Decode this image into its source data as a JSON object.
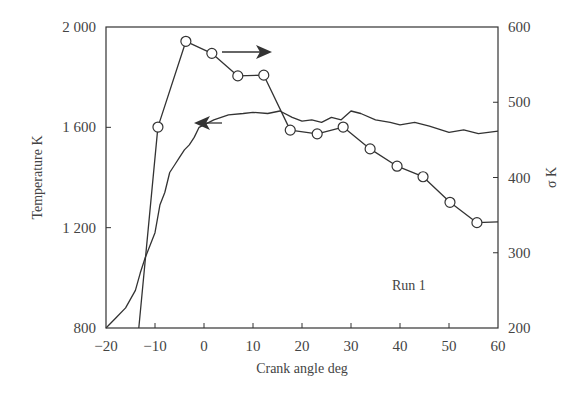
{
  "chart_data": {
    "type": "line",
    "title": "",
    "annotation": "Run 1",
    "xlabel": "Crank angle   deg",
    "ylabel_left": "Temperature   K",
    "ylabel_right": "σ   K",
    "xlim": [
      -20,
      60
    ],
    "ylim_left": [
      800,
      2000
    ],
    "ylim_right": [
      200,
      600
    ],
    "x_ticks": [
      "−20",
      "−10",
      "0",
      "10",
      "20",
      "30",
      "40",
      "50",
      "60"
    ],
    "x_tick_values": [
      -20,
      -10,
      0,
      10,
      20,
      30,
      40,
      50,
      60
    ],
    "y_left_ticks": [
      "800",
      "1 200",
      "1 600",
      "2 000"
    ],
    "y_left_tick_values": [
      800,
      1200,
      1600,
      2000
    ],
    "y_right_ticks": [
      "200",
      "300",
      "400",
      "500",
      "600"
    ],
    "y_right_tick_values": [
      200,
      300,
      400,
      500,
      600
    ],
    "grid": false,
    "series": [
      {
        "name": "Temperature",
        "axis": "left",
        "marker": "none",
        "arrow": "left",
        "x": [
          -20,
          -18,
          -16,
          -14,
          -13,
          -12,
          -11,
          -10,
          -9,
          -8,
          -7,
          -6,
          -5,
          -4,
          -3,
          -2,
          -1,
          0,
          2,
          5,
          8,
          10,
          13,
          15.5,
          18,
          20,
          22,
          24,
          26,
          28,
          30,
          32,
          35,
          38,
          40,
          43,
          46,
          50,
          53,
          56,
          58,
          60
        ],
        "values": [
          800,
          840,
          880,
          950,
          1020,
          1080,
          1130,
          1180,
          1290,
          1340,
          1420,
          1450,
          1480,
          1510,
          1530,
          1560,
          1600,
          1610,
          1630,
          1650,
          1655,
          1660,
          1655,
          1665,
          1640,
          1625,
          1630,
          1620,
          1640,
          1630,
          1665,
          1655,
          1630,
          1620,
          1610,
          1620,
          1605,
          1580,
          1590,
          1575,
          1580,
          1585
        ]
      },
      {
        "name": "σ",
        "axis": "right",
        "marker": "open-circle",
        "arrow": "right",
        "x": [
          -13.3,
          -9.4,
          -3.7,
          1.6,
          6.9,
          12.2,
          17.6,
          23.1,
          28.4,
          33.9,
          39.4,
          44.7,
          50.2,
          55.7,
          60
        ],
        "values": [
          200,
          467,
          581,
          565,
          535,
          536,
          463,
          458,
          467,
          438,
          415,
          401,
          367,
          340,
          341
        ],
        "marker_points": [
          false,
          true,
          true,
          true,
          true,
          true,
          true,
          true,
          true,
          true,
          true,
          true,
          true,
          true,
          false
        ]
      }
    ],
    "legend": "none; arrows indicate axis association"
  }
}
